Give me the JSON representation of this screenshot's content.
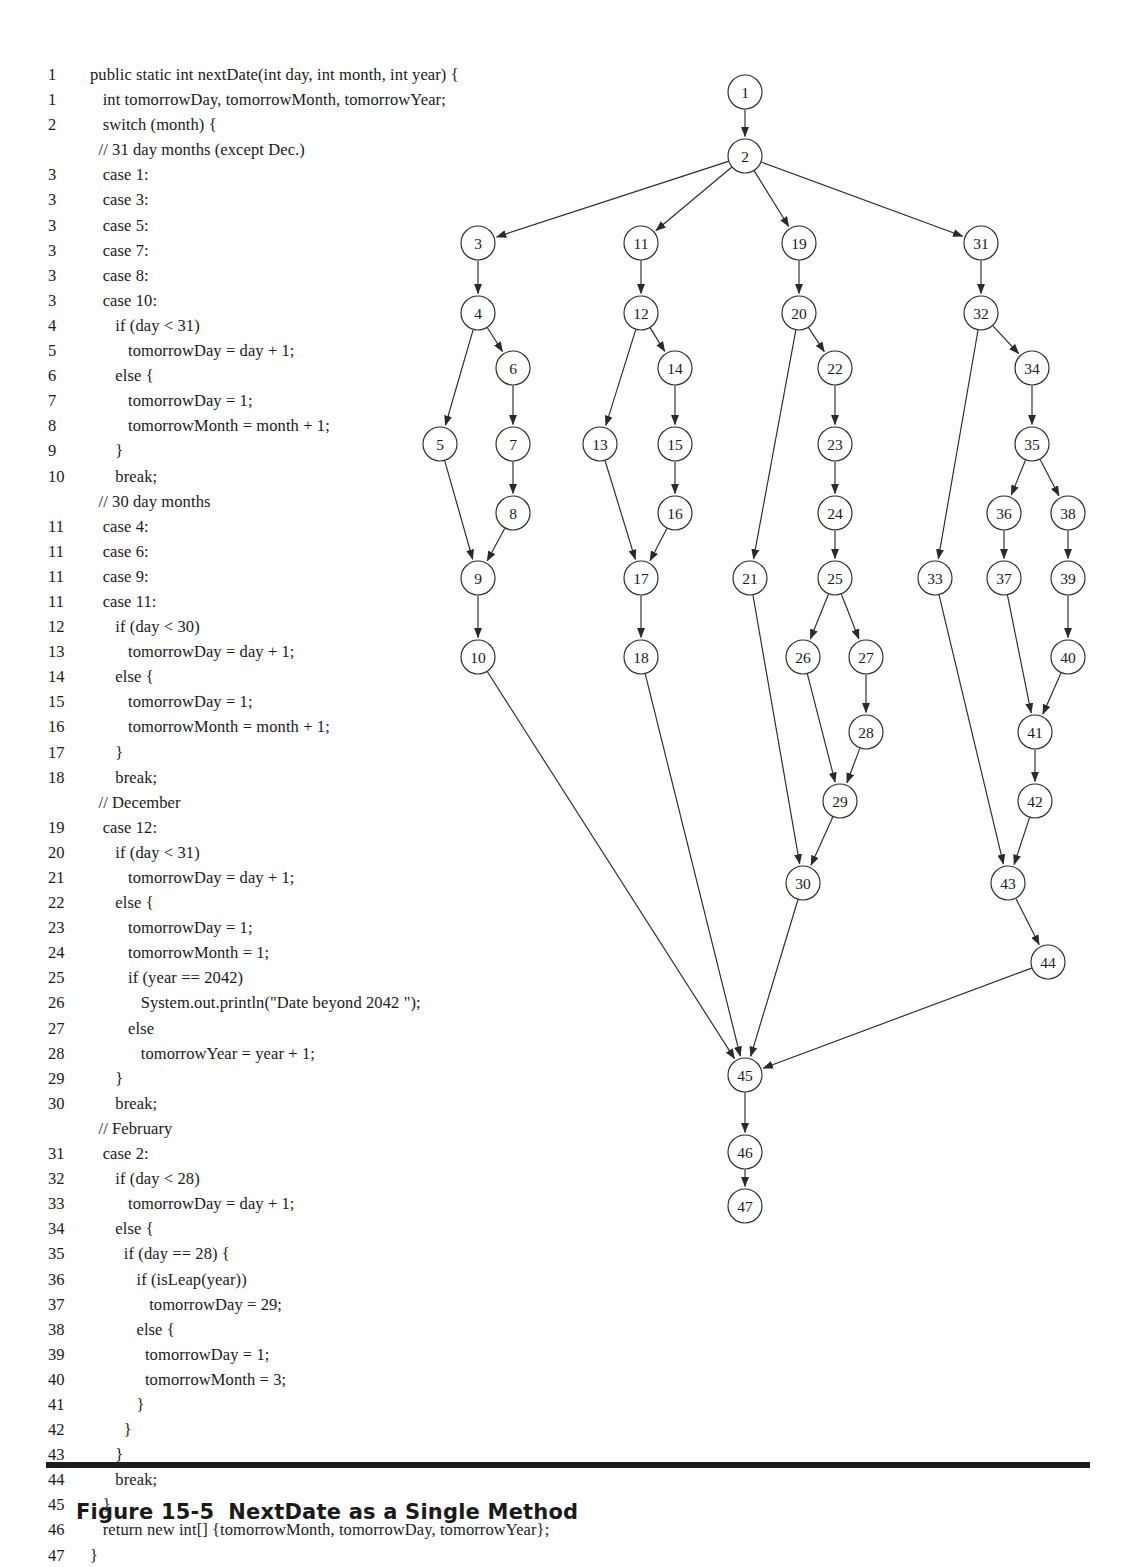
{
  "code": {
    "lines": [
      {
        "no": "1",
        "text": "public static int nextDate(int day, int month, int year) {"
      },
      {
        "no": "1",
        "text": "   int tomorrowDay, tomorrowMonth, tomorrowYear;"
      },
      {
        "no": "2",
        "text": "   switch (month) {"
      },
      {
        "no": "",
        "text": "  // 31 day months (except Dec.)"
      },
      {
        "no": "3",
        "text": "   case 1:"
      },
      {
        "no": "3",
        "text": "   case 3:"
      },
      {
        "no": "3",
        "text": "   case 5:"
      },
      {
        "no": "3",
        "text": "   case 7:"
      },
      {
        "no": "3",
        "text": "   case 8:"
      },
      {
        "no": "3",
        "text": "   case 10:"
      },
      {
        "no": "4",
        "text": "      if (day < 31)"
      },
      {
        "no": "5",
        "text": "         tomorrowDay = day + 1;"
      },
      {
        "no": "6",
        "text": "      else {"
      },
      {
        "no": "7",
        "text": "         tomorrowDay = 1;"
      },
      {
        "no": "8",
        "text": "         tomorrowMonth = month + 1;"
      },
      {
        "no": "9",
        "text": "      }"
      },
      {
        "no": "10",
        "text": "      break;"
      },
      {
        "no": "",
        "text": "  // 30 day months"
      },
      {
        "no": "11",
        "text": "   case 4:"
      },
      {
        "no": "11",
        "text": "   case 6:"
      },
      {
        "no": "11",
        "text": "   case 9:"
      },
      {
        "no": "11",
        "text": "   case 11:"
      },
      {
        "no": "12",
        "text": "      if (day < 30)"
      },
      {
        "no": "13",
        "text": "         tomorrowDay = day + 1;"
      },
      {
        "no": "14",
        "text": "      else {"
      },
      {
        "no": "15",
        "text": "         tomorrowDay = 1;"
      },
      {
        "no": "16",
        "text": "         tomorrowMonth = month + 1;"
      },
      {
        "no": "17",
        "text": "      }"
      },
      {
        "no": "18",
        "text": "      break;"
      },
      {
        "no": "",
        "text": "  // December"
      },
      {
        "no": "19",
        "text": "   case 12:"
      },
      {
        "no": "20",
        "text": "      if (day < 31)"
      },
      {
        "no": "21",
        "text": "         tomorrowDay = day + 1;"
      },
      {
        "no": "22",
        "text": "      else {"
      },
      {
        "no": "23",
        "text": "         tomorrowDay = 1;"
      },
      {
        "no": "24",
        "text": "         tomorrowMonth = 1;"
      },
      {
        "no": "25",
        "text": "         if (year == 2042)"
      },
      {
        "no": "26",
        "text": "            System.out.println(\"Date beyond 2042 \");"
      },
      {
        "no": "27",
        "text": "         else"
      },
      {
        "no": "28",
        "text": "            tomorrowYear = year + 1;"
      },
      {
        "no": "29",
        "text": "      }"
      },
      {
        "no": "30",
        "text": "      break;"
      },
      {
        "no": "",
        "text": "  // February"
      },
      {
        "no": "31",
        "text": "   case 2:"
      },
      {
        "no": "32",
        "text": "      if (day < 28)"
      },
      {
        "no": "33",
        "text": "         tomorrowDay = day + 1;"
      },
      {
        "no": "34",
        "text": "      else {"
      },
      {
        "no": "35",
        "text": "        if (day == 28) {"
      },
      {
        "no": "36",
        "text": "           if (isLeap(year))"
      },
      {
        "no": "37",
        "text": "              tomorrowDay = 29;"
      },
      {
        "no": "38",
        "text": "           else {"
      },
      {
        "no": "39",
        "text": "             tomorrowDay = 1;"
      },
      {
        "no": "40",
        "text": "             tomorrowMonth = 3;"
      },
      {
        "no": "41",
        "text": "           }"
      },
      {
        "no": "42",
        "text": "        }"
      },
      {
        "no": "43",
        "text": "      }"
      },
      {
        "no": "44",
        "text": "      break;"
      },
      {
        "no": "45",
        "text": "   }"
      },
      {
        "no": "46",
        "text": "   return new int[] {tomorrowMonth, tomorrowDay, tomorrowYear};"
      },
      {
        "no": "47",
        "text": "}"
      }
    ]
  },
  "graph": {
    "node_radius": 17,
    "nodes": [
      {
        "id": "1",
        "x": 345,
        "y": 52
      },
      {
        "id": "2",
        "x": 345,
        "y": 116
      },
      {
        "id": "3",
        "x": 78,
        "y": 203
      },
      {
        "id": "4",
        "x": 78,
        "y": 273
      },
      {
        "id": "5",
        "x": 40,
        "y": 404
      },
      {
        "id": "6",
        "x": 113,
        "y": 328
      },
      {
        "id": "7",
        "x": 113,
        "y": 404
      },
      {
        "id": "8",
        "x": 113,
        "y": 473
      },
      {
        "id": "9",
        "x": 78,
        "y": 538
      },
      {
        "id": "10",
        "x": 78,
        "y": 617
      },
      {
        "id": "11",
        "x": 241,
        "y": 203
      },
      {
        "id": "12",
        "x": 241,
        "y": 273
      },
      {
        "id": "13",
        "x": 200,
        "y": 404
      },
      {
        "id": "14",
        "x": 275,
        "y": 328
      },
      {
        "id": "15",
        "x": 275,
        "y": 404
      },
      {
        "id": "16",
        "x": 275,
        "y": 473
      },
      {
        "id": "17",
        "x": 241,
        "y": 538
      },
      {
        "id": "18",
        "x": 241,
        "y": 617
      },
      {
        "id": "19",
        "x": 399,
        "y": 203
      },
      {
        "id": "20",
        "x": 399,
        "y": 273
      },
      {
        "id": "21",
        "x": 350,
        "y": 538
      },
      {
        "id": "22",
        "x": 435,
        "y": 328
      },
      {
        "id": "23",
        "x": 435,
        "y": 404
      },
      {
        "id": "24",
        "x": 435,
        "y": 473
      },
      {
        "id": "25",
        "x": 435,
        "y": 538
      },
      {
        "id": "26",
        "x": 403,
        "y": 617
      },
      {
        "id": "27",
        "x": 466,
        "y": 617
      },
      {
        "id": "28",
        "x": 466,
        "y": 692
      },
      {
        "id": "29",
        "x": 440,
        "y": 761
      },
      {
        "id": "30",
        "x": 403,
        "y": 843
      },
      {
        "id": "31",
        "x": 581,
        "y": 203
      },
      {
        "id": "32",
        "x": 581,
        "y": 273
      },
      {
        "id": "33",
        "x": 535,
        "y": 538
      },
      {
        "id": "34",
        "x": 632,
        "y": 328
      },
      {
        "id": "35",
        "x": 632,
        "y": 404
      },
      {
        "id": "36",
        "x": 604,
        "y": 473
      },
      {
        "id": "37",
        "x": 604,
        "y": 538
      },
      {
        "id": "38",
        "x": 668,
        "y": 473
      },
      {
        "id": "39",
        "x": 668,
        "y": 538
      },
      {
        "id": "40",
        "x": 668,
        "y": 617
      },
      {
        "id": "41",
        "x": 635,
        "y": 692
      },
      {
        "id": "42",
        "x": 635,
        "y": 761
      },
      {
        "id": "43",
        "x": 608,
        "y": 843
      },
      {
        "id": "44",
        "x": 648,
        "y": 922
      },
      {
        "id": "45",
        "x": 345,
        "y": 1035
      },
      {
        "id": "46",
        "x": 345,
        "y": 1112
      },
      {
        "id": "47",
        "x": 345,
        "y": 1166
      }
    ],
    "edges": [
      [
        "1",
        "2"
      ],
      [
        "2",
        "3"
      ],
      [
        "2",
        "11"
      ],
      [
        "2",
        "19"
      ],
      [
        "2",
        "31"
      ],
      [
        "3",
        "4"
      ],
      [
        "4",
        "5"
      ],
      [
        "4",
        "6"
      ],
      [
        "6",
        "7"
      ],
      [
        "7",
        "8"
      ],
      [
        "5",
        "9"
      ],
      [
        "8",
        "9"
      ],
      [
        "9",
        "10"
      ],
      [
        "11",
        "12"
      ],
      [
        "12",
        "13"
      ],
      [
        "12",
        "14"
      ],
      [
        "14",
        "15"
      ],
      [
        "15",
        "16"
      ],
      [
        "13",
        "17"
      ],
      [
        "16",
        "17"
      ],
      [
        "17",
        "18"
      ],
      [
        "19",
        "20"
      ],
      [
        "20",
        "21"
      ],
      [
        "20",
        "22"
      ],
      [
        "22",
        "23"
      ],
      [
        "23",
        "24"
      ],
      [
        "24",
        "25"
      ],
      [
        "25",
        "26"
      ],
      [
        "25",
        "27"
      ],
      [
        "27",
        "28"
      ],
      [
        "26",
        "29"
      ],
      [
        "28",
        "29"
      ],
      [
        "21",
        "30"
      ],
      [
        "29",
        "30"
      ],
      [
        "31",
        "32"
      ],
      [
        "32",
        "33"
      ],
      [
        "32",
        "34"
      ],
      [
        "34",
        "35"
      ],
      [
        "35",
        "36"
      ],
      [
        "35",
        "38"
      ],
      [
        "36",
        "37"
      ],
      [
        "38",
        "39"
      ],
      [
        "39",
        "40"
      ],
      [
        "37",
        "41"
      ],
      [
        "40",
        "41"
      ],
      [
        "41",
        "42"
      ],
      [
        "33",
        "43"
      ],
      [
        "42",
        "43"
      ],
      [
        "43",
        "44"
      ],
      [
        "10",
        "45"
      ],
      [
        "18",
        "45"
      ],
      [
        "30",
        "45"
      ],
      [
        "44",
        "45"
      ],
      [
        "45",
        "46"
      ],
      [
        "46",
        "47"
      ]
    ]
  },
  "figure": {
    "number": "Figure 15-5",
    "title": "NextDate as a Single Method"
  }
}
